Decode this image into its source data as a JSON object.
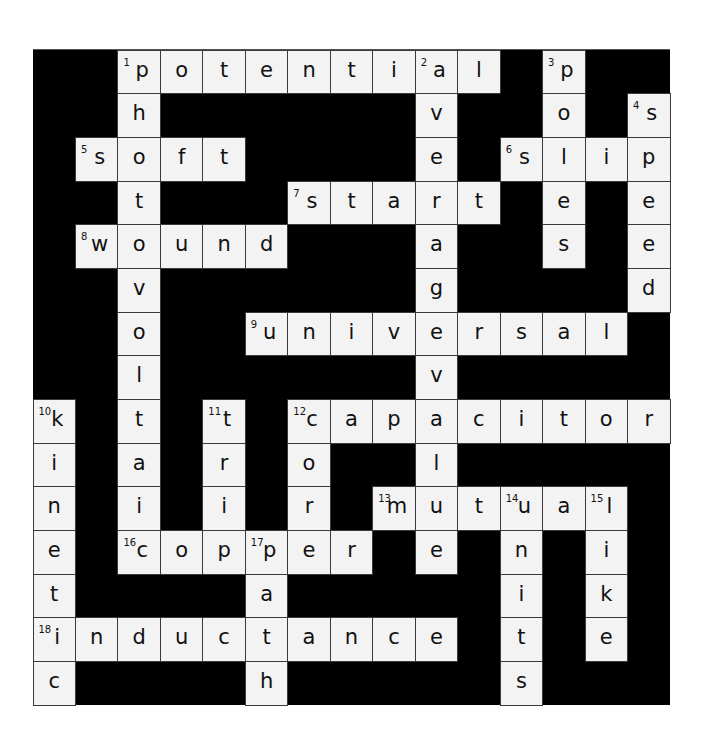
{
  "puzzle": {
    "title": "Electrical terms crossword",
    "rows": 15,
    "cols": 15,
    "grid": [
      "##potential#p##",
      "##h######v##o#s",
      "#soft####e#slip",
      "##t###start#e#e",
      "#wound###a##s#e",
      "##v######g####d",
      "##o##universal#",
      "##l######v#####",
      "k#t#t#capacitor",
      "i#a#r#o##l#####",
      "n#i#i#r#mutual#",
      "e#copper#e#n#i#",
      "t####a#####i#k#",
      "inductance#t#e#",
      "c####h#####s###"
    ],
    "numbers": [
      {
        "n": "1",
        "row": 0,
        "col": 2
      },
      {
        "n": "2",
        "row": 0,
        "col": 9
      },
      {
        "n": "3",
        "row": 0,
        "col": 12
      },
      {
        "n": "4",
        "row": 1,
        "col": 14
      },
      {
        "n": "5",
        "row": 2,
        "col": 1
      },
      {
        "n": "6",
        "row": 2,
        "col": 11
      },
      {
        "n": "7",
        "row": 3,
        "col": 6
      },
      {
        "n": "8",
        "row": 4,
        "col": 1
      },
      {
        "n": "9",
        "row": 6,
        "col": 5
      },
      {
        "n": "10",
        "row": 8,
        "col": 0
      },
      {
        "n": "11",
        "row": 8,
        "col": 4
      },
      {
        "n": "12",
        "row": 8,
        "col": 6
      },
      {
        "n": "13",
        "row": 10,
        "col": 8
      },
      {
        "n": "14",
        "row": 10,
        "col": 11
      },
      {
        "n": "15",
        "row": 10,
        "col": 13
      },
      {
        "n": "16",
        "row": 11,
        "col": 2
      },
      {
        "n": "17",
        "row": 11,
        "col": 5
      },
      {
        "n": "18",
        "row": 13,
        "col": 0
      }
    ],
    "across": [
      {
        "n": "1",
        "answer": "potential"
      },
      {
        "n": "5",
        "answer": "soft"
      },
      {
        "n": "6",
        "answer": "slip"
      },
      {
        "n": "7",
        "answer": "start"
      },
      {
        "n": "8",
        "answer": "wound"
      },
      {
        "n": "9",
        "answer": "universal"
      },
      {
        "n": "12",
        "answer": "capacitor"
      },
      {
        "n": "13",
        "answer": "mutual"
      },
      {
        "n": "16",
        "answer": "copper"
      },
      {
        "n": "18",
        "answer": "inductance"
      }
    ],
    "down": [
      {
        "n": "1",
        "answer": "photovoltaic"
      },
      {
        "n": "2",
        "answer": "averagevalue"
      },
      {
        "n": "3",
        "answer": "poles"
      },
      {
        "n": "4",
        "answer": "speed"
      },
      {
        "n": "10",
        "answer": "kinetic"
      },
      {
        "n": "11",
        "answer": "trip"
      },
      {
        "n": "12",
        "answer": "core"
      },
      {
        "n": "14",
        "answer": "units"
      },
      {
        "n": "15",
        "answer": "like"
      },
      {
        "n": "17",
        "answer": "path"
      }
    ],
    "colors": {
      "block": "#000000",
      "cell": "#f3f3f3",
      "text": "#111111"
    }
  }
}
